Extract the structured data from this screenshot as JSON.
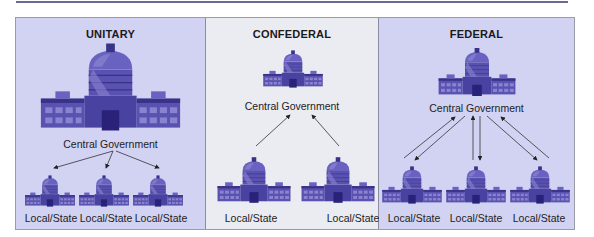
{
  "diagram": {
    "panels": [
      {
        "title": "UNITARY",
        "central_label": "Central Government",
        "local_labels": [
          "Local/State",
          "Local/State",
          "Local/State"
        ],
        "arrow_direction": "central-to-local",
        "background": "#d2d2f2"
      },
      {
        "title": "CONFEDERAL",
        "central_label": "Central Government",
        "local_labels": [
          "Local/State",
          "Local/State"
        ],
        "arrow_direction": "local-to-central",
        "background": "#ebebf2"
      },
      {
        "title": "FEDERAL",
        "central_label": "Central Government",
        "local_labels": [
          "Local/State",
          "Local/State",
          "Local/State"
        ],
        "arrow_direction": "bidirectional",
        "background": "#d2d2f2"
      }
    ],
    "colors": {
      "building": "#5a52b0",
      "building_dark": "#3a3288",
      "building_light": "#8a84d0",
      "rule": "#6a6a94"
    },
    "icons": [
      "capitol-building-icon"
    ]
  }
}
